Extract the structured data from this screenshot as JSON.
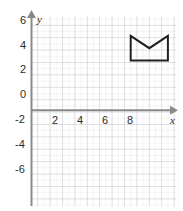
{
  "chart_data": {
    "type": "scatter",
    "title": "",
    "xlabel": "x",
    "ylabel": "y",
    "xlim": [
      -0.6,
      12.2
    ],
    "ylim": [
      -6.6,
      6.6
    ],
    "grid": true,
    "minor_grid_step": 0.5,
    "major_grid_step": 1,
    "legend": "none",
    "x_tick_labels": [
      "2",
      "4",
      "6",
      "8"
    ],
    "x_tick_values": [
      2,
      4,
      6,
      8
    ],
    "y_tick_labels": [
      "6",
      "4",
      "2",
      "0",
      "-2",
      "-4",
      "-6"
    ],
    "y_tick_values": [
      6,
      4,
      2,
      0,
      -2,
      -4,
      -6
    ],
    "series": [
      {
        "name": "crown-polygon",
        "type": "polygon",
        "closed": true,
        "stroke": "#231f20",
        "fill": "none",
        "points": [
          [
            8,
            6
          ],
          [
            9.5,
            5
          ],
          [
            11,
            6
          ],
          [
            11,
            4
          ],
          [
            8,
            4
          ]
        ]
      }
    ],
    "colors": {
      "axis": "#808080",
      "minor_grid": "#e8e8ec",
      "major_grid": "#c9c9d0",
      "shape_stroke": "#231f20",
      "label_text": "#2b2b2b",
      "background": "#ffffff"
    }
  },
  "labels": {
    "x_axis_name": "x",
    "y_axis_name": "y",
    "x_ticks": [
      {
        "text": "2",
        "value": 2
      },
      {
        "text": "4",
        "value": 4
      },
      {
        "text": "6",
        "value": 6
      },
      {
        "text": "8",
        "value": 8
      }
    ],
    "y_ticks": [
      {
        "text": "6",
        "value": 6
      },
      {
        "text": "4",
        "value": 4
      },
      {
        "text": "2",
        "value": 2
      },
      {
        "text": "0",
        "value": 0
      },
      {
        "text": "-2",
        "value": -2
      },
      {
        "text": "-4",
        "value": -4
      },
      {
        "text": "-6",
        "value": -6
      }
    ]
  }
}
